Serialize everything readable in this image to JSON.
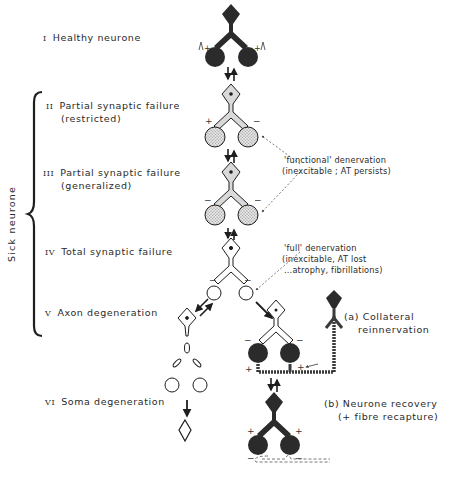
{
  "stages": [
    {
      "numeral": "I",
      "label": "Healthy neurone"
    },
    {
      "numeral": "II",
      "label": "Partial synaptic failure",
      "sub": "(restricted)"
    },
    {
      "numeral": "III",
      "label": "Partial synaptic failure",
      "sub": "(generalized)"
    },
    {
      "numeral": "IV",
      "label": "Total synaptic failure"
    },
    {
      "numeral": "V",
      "label": "Axon degeneration"
    },
    {
      "numeral": "VI",
      "label": "Soma degeneration"
    }
  ],
  "group_label": "Sick neurone",
  "annotations": {
    "functional": {
      "line1": "'functional' denervation",
      "line2": "(inexcitable  ; AT persists)"
    },
    "full": {
      "line1": "'full' denervation",
      "line2": "(inexcitable, AT lost",
      "line3": "...atrophy, fibrillations)"
    }
  },
  "outcomes": {
    "a": {
      "line1": "(a)  Collateral",
      "line2": "reinnervation"
    },
    "b": {
      "line1": "(b)  Neurone  recovery",
      "line2": "(+ fibre  recapture)"
    }
  },
  "colors": {
    "ink": "#1e1e1e",
    "healthy_fill": "#2b2b2b",
    "stippled_fill": "#c8c8c8"
  }
}
